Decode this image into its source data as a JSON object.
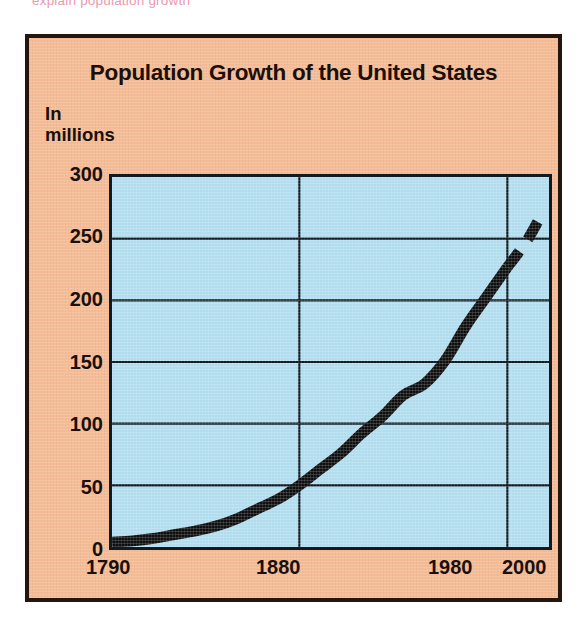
{
  "top_caption": "explain population growth",
  "figure": {
    "title": "Population Growth of the United States",
    "y_axis_label_line1": "In",
    "y_axis_label_line2": "millions",
    "frame_color": "#F4BD97",
    "plot_background_color": "#B0DCEE",
    "border_color": "#24160F",
    "curve_color": "#101010"
  },
  "chart_data": {
    "type": "line",
    "title": "Population Growth of the United States",
    "xlabel": "",
    "ylabel": "In millions",
    "xlim": [
      1790,
      2000
    ],
    "ylim": [
      0,
      300
    ],
    "grid": true,
    "legend": "none",
    "x_ticks": [
      "1790",
      "1880",
      "1980",
      "2000"
    ],
    "x_tick_values": [
      1790,
      1880,
      1980,
      2000
    ],
    "y_ticks": [
      "0",
      "50",
      "100",
      "150",
      "200",
      "250",
      "300"
    ],
    "y_tick_values": [
      0,
      50,
      100,
      150,
      200,
      250,
      300
    ],
    "series": [
      {
        "name": "United States population (actual)",
        "style": "solid-thick",
        "x": [
          1790,
          1800,
          1810,
          1820,
          1830,
          1840,
          1850,
          1860,
          1870,
          1880,
          1890,
          1900,
          1910,
          1920,
          1930,
          1940,
          1950,
          1960,
          1970,
          1980
        ],
        "values": [
          4,
          5,
          7,
          10,
          13,
          17,
          23,
          31,
          39,
          50,
          63,
          76,
          92,
          106,
          123,
          132,
          151,
          179,
          203,
          227
        ]
      },
      {
        "name": "Projected population",
        "style": "dashed-thick",
        "x": [
          1980,
          1985,
          1990,
          1995
        ],
        "values": [
          227,
          238,
          250,
          265
        ]
      }
    ],
    "annotations": [
      "Curve is drawn solid through 1980 and dashed beyond 1980 to indicate projection."
    ]
  }
}
